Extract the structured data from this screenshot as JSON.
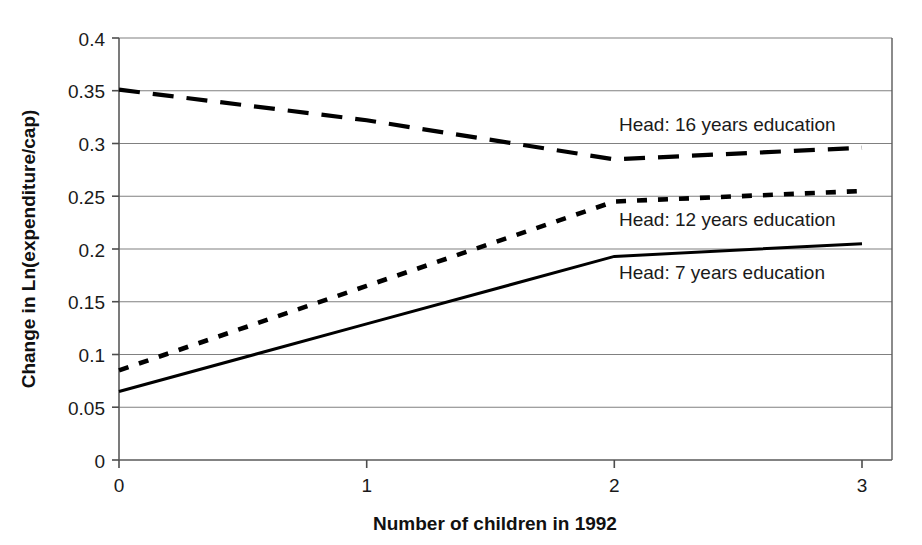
{
  "chart_data": {
    "type": "line",
    "title": "",
    "xlabel": "Number of children in 1992",
    "ylabel": "Change in Ln(expenditure/cap)",
    "x": [
      0,
      1,
      2,
      3
    ],
    "xlim": [
      0,
      3
    ],
    "ylim": [
      0,
      0.4
    ],
    "xticks": [
      "0",
      "1",
      "2",
      "3"
    ],
    "yticks": [
      "0",
      "0.05",
      "0.1",
      "0.15",
      "0.2",
      "0.25",
      "0.3",
      "0.35",
      "0.4"
    ],
    "ytick_values": [
      0,
      0.05,
      0.1,
      0.15,
      0.2,
      0.25,
      0.3,
      0.35,
      0.4
    ],
    "grid": "horizontal",
    "legend_position": "inline-annotations",
    "series": [
      {
        "name": "Head: 16 years education",
        "style": "dashed",
        "values": [
          0.351,
          0.322,
          0.285,
          0.296
        ],
        "color": "#000000"
      },
      {
        "name": "Head: 12 years education",
        "style": "dotted",
        "values": [
          0.085,
          0.165,
          0.245,
          0.255
        ],
        "color": "#000000"
      },
      {
        "name": "Head: 7 years education",
        "style": "solid",
        "values": [
          0.065,
          0.129,
          0.193,
          0.205
        ],
        "color": "#000000"
      }
    ],
    "annotations": [
      {
        "text": "Head: 16 years education",
        "x": 1.78,
        "y": 0.318
      },
      {
        "text": "Head: 12 years education",
        "x": 1.78,
        "y": 0.222
      },
      {
        "text": "Head: 7 years education",
        "x": 1.78,
        "y": 0.172
      }
    ]
  },
  "axes": {
    "x_title": "Number of children in 1992",
    "y_title": "Change in Ln(expenditure/cap)",
    "x_tick_0": "0",
    "x_tick_1": "1",
    "x_tick_2": "2",
    "x_tick_3": "3",
    "y_tick_0": "0",
    "y_tick_1": "0.05",
    "y_tick_2": "0.1",
    "y_tick_3": "0.15",
    "y_tick_4": "0.2",
    "y_tick_5": "0.25",
    "y_tick_6": "0.3",
    "y_tick_7": "0.35",
    "y_tick_8": "0.4"
  },
  "labels": {
    "annot_16": "Head: 16 years education",
    "annot_12": "Head: 12 years education",
    "annot_7": "Head: 7 years education"
  },
  "colors": {
    "ink": "#000000",
    "grid": "#808080",
    "axis": "#5a5a5a",
    "background": "#ffffff"
  }
}
